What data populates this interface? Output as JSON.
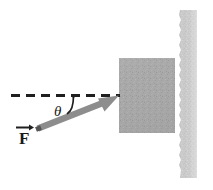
{
  "figure": {
    "background_color": "#ffffff",
    "width": 213,
    "height": 190
  },
  "labels": {
    "angle": "θ",
    "force": "F",
    "force_vector_notation": "arrow-overbar"
  },
  "colors": {
    "block_fill": "#a8a8a8",
    "wall_fill": "#c8c8c8",
    "arrow_fill": "#8a8a8a",
    "line_stroke": "#1a1a1a",
    "text": "#1a1a1a"
  },
  "geometry": {
    "wall": {
      "x": 174,
      "y": 10,
      "width": 23,
      "height": 168,
      "edge": "jagged-left"
    },
    "block": {
      "x": 119,
      "y": 58,
      "width": 55,
      "height": 75
    },
    "dashed_line": {
      "x1": 10,
      "y1": 95,
      "x2": 119,
      "y2": 95,
      "dash": "9 6",
      "stroke_width": 3
    },
    "force_arrow": {
      "tail_x": 37,
      "tail_y": 128,
      "tip_x": 118,
      "tip_y": 96,
      "shaft_width": 6
    },
    "angle_arc": {
      "vertex_x": 119,
      "vertex_y": 95,
      "radius": 46
    }
  },
  "elements": {
    "wall_name": "wall",
    "block_name": "block",
    "dashed_line_name": "horizontal-reference-dashed-line",
    "arrow_name": "force-vector-arrow",
    "arc_name": "angle-arc"
  }
}
